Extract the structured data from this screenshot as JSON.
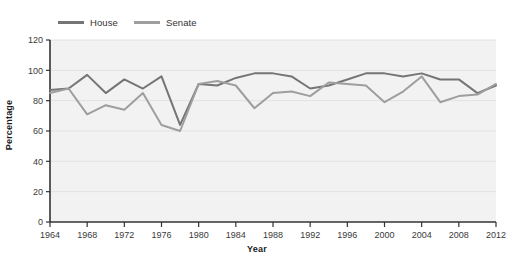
{
  "chart_data": {
    "type": "line",
    "title": "",
    "xlabel": "Year",
    "ylabel": "Percentage",
    "xlim": [
      1964,
      2012
    ],
    "ylim": [
      0,
      120
    ],
    "y_ticks": [
      0,
      20,
      40,
      60,
      80,
      100,
      120
    ],
    "x_ticks": [
      1964,
      1968,
      1972,
      1976,
      1980,
      1984,
      1988,
      1992,
      1996,
      2000,
      2004,
      2008,
      2012
    ],
    "grid": "horizontal",
    "legend_position": "top-left",
    "x": [
      1964,
      1966,
      1968,
      1970,
      1972,
      1974,
      1976,
      1978,
      1980,
      1982,
      1984,
      1986,
      1988,
      1990,
      1992,
      1994,
      1996,
      1998,
      2000,
      2002,
      2004,
      2006,
      2008,
      2010,
      2012
    ],
    "series": [
      {
        "name": "House",
        "color": "#757575",
        "values": [
          87,
          88,
          97,
          85,
          94,
          88,
          96,
          64,
          91,
          90,
          95,
          98,
          98,
          96,
          88,
          90,
          94,
          98,
          98,
          96,
          98,
          94,
          94,
          85,
          90
        ]
      },
      {
        "name": "Senate",
        "color": "#9e9e9e",
        "values": [
          85,
          88,
          71,
          77,
          74,
          85,
          64,
          60,
          91,
          93,
          90,
          75,
          85,
          86,
          83,
          92,
          91,
          90,
          79,
          86,
          96,
          79,
          83,
          84,
          91
        ]
      }
    ],
    "annotations": [],
    "background_color": "#f2f2f2",
    "gridline_color": "#e2e2e2",
    "axis_color": "#333333"
  },
  "legend": {
    "items": [
      {
        "label": "House",
        "color": "#757575"
      },
      {
        "label": "Senate",
        "color": "#9e9e9e"
      }
    ]
  },
  "axes": {
    "y_title": "Percentage",
    "x_title": "Year"
  }
}
